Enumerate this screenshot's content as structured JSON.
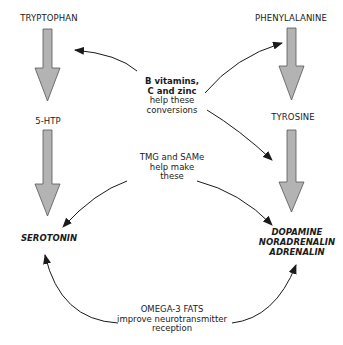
{
  "diagram": {
    "left_pathway": {
      "start": "TRYPTOPHAN",
      "intermediate": "5-HTP",
      "end": "SEROTONIN"
    },
    "right_pathway": {
      "start": "PHENYLALANINE",
      "intermediate": "TYROSINE",
      "end_lines": [
        "DOPAMINE",
        "NORADRENALIN",
        "ADRENALIN"
      ]
    },
    "notes": {
      "cofactors": {
        "lines": [
          "B vitamins,",
          "C and zinc",
          "help these",
          "conversions"
        ]
      },
      "methylation": {
        "lines": [
          "TMG and SAMe",
          "help make",
          "these"
        ]
      },
      "omega": {
        "lines": [
          "OMEGA-3 FATS",
          "improve neurotransmitter",
          "reception"
        ]
      }
    },
    "colors": {
      "block_arrow_fill": "#b3b3b3",
      "block_arrow_stroke": "#555555",
      "line_arrow": "#1a1a1a",
      "text": "#1a1a1a"
    }
  }
}
